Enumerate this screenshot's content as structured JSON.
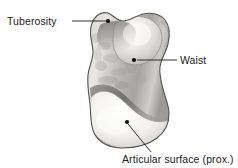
{
  "figure": {
    "kind": "anatomical-bone-illustration",
    "background_color": "#ffffff",
    "outline_color": "#4a4a4a",
    "fill_light": "#f2f1ef",
    "fill_mid": "#c9c7c4",
    "fill_dark": "#8e8c89",
    "label_color": "#1c1c1c",
    "leader_color": "#1c1c1c"
  },
  "labels": {
    "tuberosity": {
      "text": "Tuberosity",
      "leader": {
        "x1": 72,
        "y1": 21,
        "x2": 106,
        "y2": 21
      },
      "dot": {
        "cx": 108,
        "cy": 21,
        "r": 2.1
      }
    },
    "waist": {
      "text": "Waist",
      "leader": {
        "x1": 137,
        "y1": 60,
        "x2": 177,
        "y2": 60
      },
      "dot": {
        "cx": 134,
        "cy": 60,
        "r": 2.1
      }
    },
    "articular_surface": {
      "text": "Articular surface (prox.)",
      "leader": {
        "x1": 128,
        "y1": 124,
        "x2": 151,
        "y2": 152
      },
      "dot": {
        "cx": 127,
        "cy": 122,
        "r": 2.1
      }
    }
  },
  "shape": {
    "outline_path": "M 108 13 C 100 11 93 17 91 27 C 89 36 93 44 93 52 C 93 60 89 66 88 75 C 87 85 89 95 90 104 C 91 114 90 124 94 133 C 99 143 110 148 122 148 C 135 148 148 145 157 138 C 165 132 169 123 169 114 C 169 105 165 97 163 89 C 161 81 159 74 160 67 C 161 59 166 52 168 44 C 170 35 170 26 165 20 C 160 14 151 12 143 14 C 135 16 129 21 123 21 C 117 21 113 15 108 13 Z",
    "upper_lobe_path": "M 118 20 C 127 17 138 15 147 18 C 156 21 162 29 162 38 C 162 47 157 56 149 61 C 141 66 131 66 124 62 C 117 58 113 50 113 41 C 113 32 114 23 118 20 Z",
    "ridge_path": "M 95 33 C 103 29 112 26 120 25 C 129 24 138 25 145 29",
    "waist_band_path": "M 92 91 C 101 86 112 88 121 95 C 130 102 138 111 148 116 C 155 120 162 121 168 119",
    "lower_lobe_path": "M 90 100 C 95 92 105 90 114 95 C 124 101 132 112 143 118 C 152 123 161 124 168 121 C 168 130 163 139 154 144 C 144 149 131 149 120 147 C 108 145 98 139 93 130 C 89 121 88 110 90 100 Z"
  }
}
